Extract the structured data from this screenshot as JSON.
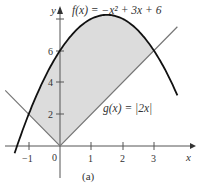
{
  "chart_data": {
    "type": "line",
    "title": "",
    "caption": "(a)",
    "xlabel": "x",
    "ylabel": "y",
    "xlim": [
      -1.9,
      3.8
    ],
    "ylim": [
      -2.2,
      9
    ],
    "x_ticks": [
      -1,
      0,
      1,
      2,
      3
    ],
    "x_tick_labels": [
      "-1",
      "0",
      "1",
      "2",
      "3"
    ],
    "y_ticks": [
      2,
      4,
      6,
      8
    ],
    "y_tick_labels": [
      "2",
      "4",
      "6",
      ""
    ],
    "grid": false,
    "series": [
      {
        "name": "f(x) = −x² + 3x + 6",
        "expression": "-x^2+3x+6",
        "color": "#111111"
      },
      {
        "name": "g(x) = |2x|",
        "expression": "abs(2x)",
        "color": "#777777"
      }
    ],
    "shaded_region": {
      "between": [
        "f",
        "g"
      ],
      "x_from": -1,
      "x_to": 3,
      "color": "#d9d9d9"
    },
    "intersections": [
      [
        -1,
        2
      ],
      [
        3,
        6
      ]
    ],
    "annotations": [
      {
        "text": "f(x) = −x² + 3x + 6",
        "x": 0.4,
        "y": 8.6
      },
      {
        "text": "g(x) = |2x|",
        "x": 1.5,
        "y": 2.6
      }
    ]
  },
  "labels": {
    "f_label": "f(x) = −x² + 3x + 6",
    "g_label": "g(x) = |2x|",
    "x_axis": "x",
    "y_axis": "y",
    "caption": "(a)",
    "t_m1": "−1",
    "t_0": "0",
    "t_1": "1",
    "t_2": "2",
    "t_3": "3",
    "t_y2": "2",
    "t_y4": "4",
    "t_y6": "6"
  }
}
